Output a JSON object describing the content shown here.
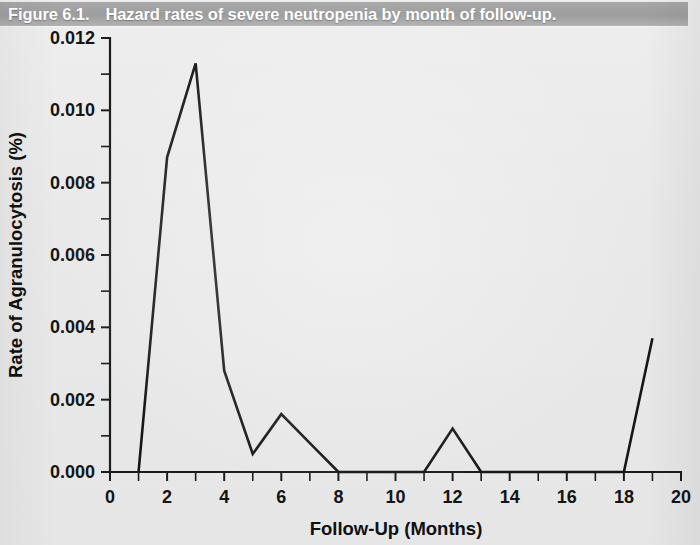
{
  "figure": {
    "caption_number": "Figure 6.1.",
    "caption_text": "Hazard rates of severe neutropenia by month of follow-up."
  },
  "chart_data": {
    "type": "line",
    "title": "Hazard rates of severe neutropenia by month of follow-up.",
    "xlabel": "Follow-Up (Months)",
    "ylabel": "Rate of Agranulocytosis (%)",
    "xlim": [
      0,
      20
    ],
    "ylim": [
      0,
      0.012
    ],
    "x_major_ticks": [
      0,
      2,
      4,
      6,
      8,
      10,
      12,
      14,
      16,
      18,
      20
    ],
    "x_tick_labels": [
      "0",
      "2",
      "4",
      "6",
      "8",
      "10",
      "12",
      "14",
      "16",
      "18",
      "20"
    ],
    "x_minor_tick_step": 1,
    "y_major_ticks": [
      0.0,
      0.002,
      0.004,
      0.006,
      0.008,
      0.01,
      0.012
    ],
    "y_tick_labels": [
      "0.000",
      "0.002",
      "0.004",
      "0.006",
      "0.008",
      "0.010",
      "0.012"
    ],
    "grid": false,
    "legend": null,
    "series": [
      {
        "name": "Hazard rate of severe neutropenia",
        "color": "#161616",
        "x": [
          1,
          2,
          3,
          4,
          5,
          6,
          7,
          8,
          11,
          12,
          13,
          18,
          19
        ],
        "y": [
          0.0,
          0.0087,
          0.0113,
          0.0028,
          0.0005,
          0.0016,
          0.0008,
          0.0,
          0.0,
          0.0012,
          0.0,
          0.0,
          0.0037
        ]
      }
    ]
  },
  "colors": {
    "banner": "#9d9d9d",
    "banner_text": "#ffffff",
    "page_background": "#e9e9e9",
    "axis": "#1c1c1c",
    "line": "#161616"
  }
}
